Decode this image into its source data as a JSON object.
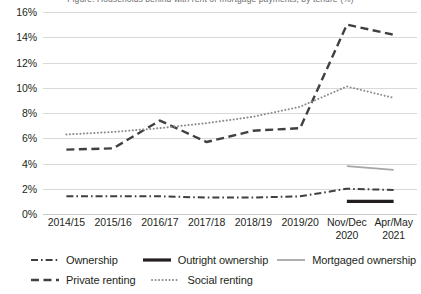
{
  "clipped_header": "Figure: Households behind with rent or mortgage payments, by tenure (%)",
  "chart_data": {
    "type": "line",
    "title": "",
    "xlabel": "",
    "ylabel": "",
    "ylim": [
      0,
      16
    ],
    "y_ticks": [
      0,
      2,
      4,
      6,
      8,
      10,
      12,
      14,
      16
    ],
    "y_tick_labels": [
      "0%",
      "2%",
      "4%",
      "6%",
      "8%",
      "10%",
      "12%",
      "14%",
      "16%"
    ],
    "grid": true,
    "legend_position": "bottom",
    "categories": [
      "2014/15",
      "2015/16",
      "2016/17",
      "2017/18",
      "2018/19",
      "2019/20",
      "Nov/Dec\n2020",
      "Apr/May\n2021"
    ],
    "series": [
      {
        "name": "Ownership",
        "style": "dash-dot",
        "color": "#3f3f3f",
        "width": 2,
        "values": [
          1.4,
          1.4,
          1.4,
          1.3,
          1.3,
          1.4,
          2.0,
          1.9
        ]
      },
      {
        "name": "Outright ownership",
        "style": "solid-thick",
        "color": "#231f20",
        "width": 3.2,
        "values": [
          null,
          null,
          null,
          null,
          null,
          null,
          1.0,
          1.0
        ]
      },
      {
        "name": "Mortgaged ownership",
        "style": "solid-thin",
        "color": "#a6a6a6",
        "width": 1.8,
        "values": [
          null,
          null,
          null,
          null,
          null,
          null,
          3.8,
          3.5
        ]
      },
      {
        "name": "Private renting",
        "style": "dashed",
        "color": "#404040",
        "width": 2.4,
        "values": [
          5.1,
          5.2,
          7.4,
          5.7,
          6.6,
          6.8,
          15.0,
          14.2
        ]
      },
      {
        "name": "Social renting",
        "style": "dotted",
        "color": "#8c8c8c",
        "width": 2,
        "values": [
          6.3,
          6.5,
          6.8,
          7.2,
          7.7,
          8.5,
          10.1,
          9.2
        ]
      }
    ]
  },
  "legend": {
    "rows": [
      [
        "Ownership",
        "Outright ownership",
        "Mortgaged ownership"
      ],
      [
        "Private renting",
        "Social renting"
      ]
    ]
  }
}
